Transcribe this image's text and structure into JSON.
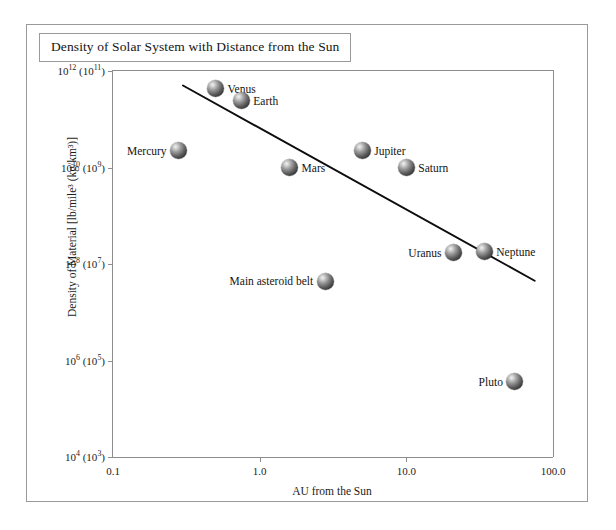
{
  "figure": {
    "title": "Density of Solar System with Distance from the Sun"
  },
  "chart_data": {
    "type": "scatter",
    "title": "Density of Solar System with Distance from the Sun",
    "xlabel": "AU from the Sun",
    "ylabel": "Density of Material [lb/mile³ (kg/km³)]",
    "xscale": "log",
    "yscale": "log",
    "xlim": [
      0.1,
      100.0
    ],
    "ylim": [
      10000.0,
      1000000000000.0
    ],
    "grid": false,
    "legend": false,
    "xticks": [
      {
        "value": 0.1,
        "label": "0.1"
      },
      {
        "value": 1.0,
        "label": "1.0"
      },
      {
        "value": 10.0,
        "label": "10.0"
      },
      {
        "value": 100.0,
        "label": "100.0"
      }
    ],
    "yticks": [
      {
        "value": 1000000000000.0,
        "label": "10",
        "exp": "12",
        "alt_label": "10",
        "alt_exp": "11"
      },
      {
        "value": 10000000000.0,
        "label": "10",
        "exp": "10",
        "alt_label": "10",
        "alt_exp": "9"
      },
      {
        "value": 100000000.0,
        "label": "10",
        "exp": "8",
        "alt_label": "10",
        "alt_exp": "7"
      },
      {
        "value": 1000000.0,
        "label": "10",
        "exp": "6",
        "alt_label": "10",
        "alt_exp": "5"
      },
      {
        "value": 10000.0,
        "label": "10",
        "exp": "4",
        "alt_label": "10",
        "alt_exp": "3"
      }
    ],
    "points": [
      {
        "name": "Mercury",
        "x": 0.28,
        "y": 22000000000.0,
        "label_side": "left"
      },
      {
        "name": "Venus",
        "x": 0.5,
        "y": 430000000000.0,
        "label_side": "right"
      },
      {
        "name": "Earth",
        "x": 0.75,
        "y": 240000000000.0,
        "label_side": "right"
      },
      {
        "name": "Mars",
        "x": 1.6,
        "y": 10000000000.0,
        "label_side": "right"
      },
      {
        "name": "Main asteroid belt",
        "x": 2.8,
        "y": 44000000.0,
        "label_side": "left"
      },
      {
        "name": "Jupiter",
        "x": 5.0,
        "y": 22000000000.0,
        "label_side": "right"
      },
      {
        "name": "Saturn",
        "x": 10.0,
        "y": 10000000000.0,
        "label_side": "right"
      },
      {
        "name": "Uranus",
        "x": 21.0,
        "y": 170000000.0,
        "label_side": "left"
      },
      {
        "name": "Neptune",
        "x": 34.0,
        "y": 180000000.0,
        "label_side": "right"
      },
      {
        "name": "Pluto",
        "x": 55.0,
        "y": 360000.0,
        "label_side": "left"
      }
    ],
    "trendline": {
      "x_start": 0.3,
      "y_start": 500000000000.0,
      "x_end": 75.0,
      "y_end": 45000000.0
    },
    "colors": {
      "frame": "#9a9a9a",
      "axis": "#8d8d8d",
      "text": "#141414",
      "trendline": "#0d0d0d",
      "marker_light": "#f2f2f2",
      "marker_dark": "#141414",
      "background": "#ffffff"
    }
  }
}
